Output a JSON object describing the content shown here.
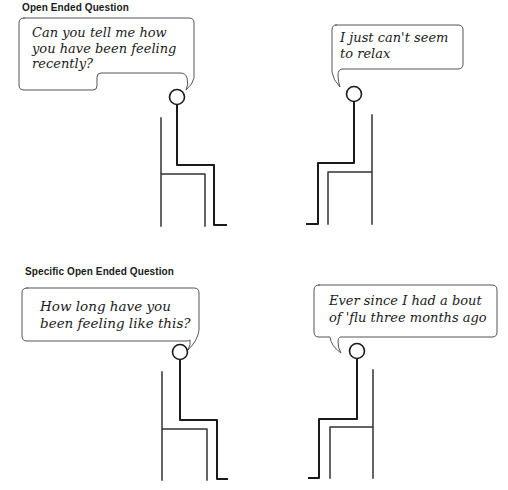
{
  "panels": [
    {
      "title": "Open Ended Question",
      "interviewer_speech": "Can you tell me how\nyou have been feeling\nrecently?",
      "patient_speech": "I just can't seem\nto relax"
    },
    {
      "title": "Specific Open Ended Question",
      "interviewer_speech": "How long have you\nbeen feeling like this?",
      "patient_speech": "Ever since I had a bout\nof 'flu three months ago"
    }
  ],
  "colors": {
    "ink": "#1a1a1a",
    "bubble_stroke": "#555555",
    "background": "#ffffff"
  }
}
